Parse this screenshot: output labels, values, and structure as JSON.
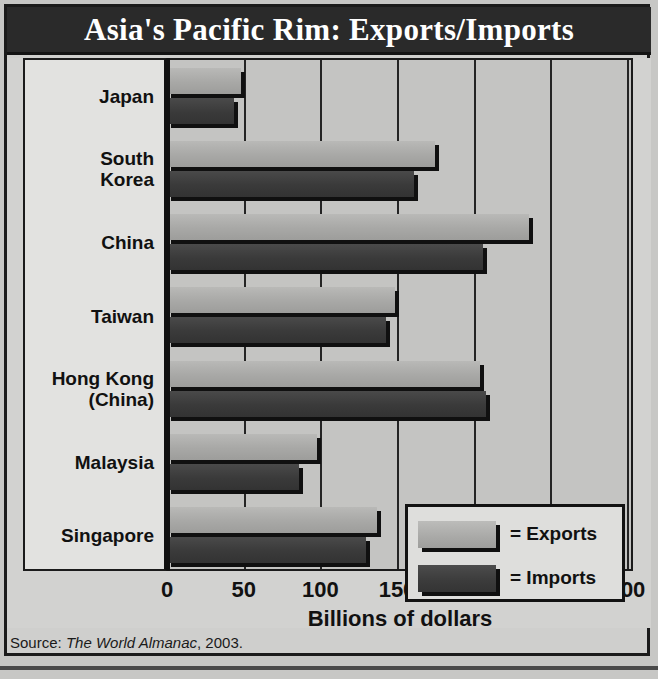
{
  "title": "Asia's Pacific Rim: Exports/Imports",
  "source": {
    "prefix": "Source: ",
    "publication": "The World Almanac",
    "suffix": ", 2003."
  },
  "legend": {
    "exports_label": "= Exports",
    "imports_label": "= Imports"
  },
  "chart_data": {
    "type": "bar",
    "orientation": "horizontal",
    "title": "Asia's Pacific Rim: Exports/Imports",
    "xlabel": "Billions of dollars",
    "ylabel": "Pacific Rim countries",
    "xlim": [
      0,
      300
    ],
    "xticks": [
      0,
      50,
      100,
      150,
      200,
      250,
      300
    ],
    "xtick_labels": [
      "0",
      "50",
      "100",
      "150",
      "200",
      "250",
      "300"
    ],
    "grid": true,
    "legend_position": "inside-lower-right",
    "categories": [
      "Japan",
      "South Korea",
      "China",
      "Taiwan",
      "Hong Kong (China)",
      "Malaysia",
      "Singapore"
    ],
    "series": [
      {
        "name": "Exports",
        "color": "#a9a9a7",
        "values": [
          48,
          175,
          236,
          149,
          204,
          98,
          137
        ]
      },
      {
        "name": "Imports",
        "color": "#3b3b3b",
        "values": [
          44,
          161,
          206,
          143,
          208,
          86,
          130
        ]
      }
    ]
  },
  "category_labels": [
    {
      "line1": "Japan",
      "line2": ""
    },
    {
      "line1": "South",
      "line2": "Korea"
    },
    {
      "line1": "China",
      "line2": ""
    },
    {
      "line1": "Taiwan",
      "line2": ""
    },
    {
      "line1": "Hong Kong",
      "line2": "(China)"
    },
    {
      "line1": "Malaysia",
      "line2": ""
    },
    {
      "line1": "Singapore",
      "line2": ""
    }
  ]
}
